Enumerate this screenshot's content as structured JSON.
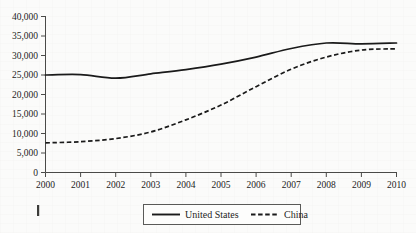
{
  "chart_data": {
    "type": "line",
    "title": "",
    "subtitle": "",
    "xlabel": "",
    "ylabel": "",
    "x": [
      2000,
      2001,
      2002,
      2003,
      2004,
      2005,
      2006,
      2007,
      2008,
      2009,
      2010
    ],
    "categories": [
      "2000",
      "2001",
      "2002",
      "2003",
      "2004",
      "2005",
      "2006",
      "2007",
      "2008",
      "2009",
      "2010"
    ],
    "series": [
      {
        "name": "United States",
        "style": "solid",
        "color": "#1a1a1a",
        "values": [
          25000,
          25100,
          24200,
          25300,
          26400,
          27800,
          29600,
          31800,
          33200,
          33000,
          33200
        ]
      },
      {
        "name": "China",
        "style": "dashed",
        "color": "#1a1a1a",
        "values": [
          7600,
          7900,
          8700,
          10400,
          13500,
          17300,
          22000,
          26500,
          29600,
          31400,
          31700
        ]
      }
    ],
    "ylim": [
      0,
      40000
    ],
    "yticks": [
      0,
      5000,
      10000,
      15000,
      20000,
      25000,
      30000,
      35000,
      40000
    ],
    "ytick_labels": [
      "0",
      "5,000",
      "10,000",
      "15,000",
      "20,000",
      "25,000",
      "30,000",
      "35,000",
      "40,000"
    ],
    "xtick_labels": [
      "2000",
      "2001",
      "2002",
      "2003",
      "2004",
      "2005",
      "2006",
      "2007",
      "2008",
      "2009",
      "2010"
    ],
    "grid": false,
    "legend_position": "bottom-center",
    "legend_entries": [
      {
        "label": "United States",
        "style": "solid"
      },
      {
        "label": "China",
        "style": "dashed"
      }
    ]
  },
  "margin_mark": {
    "name": "page-margin-tick"
  }
}
